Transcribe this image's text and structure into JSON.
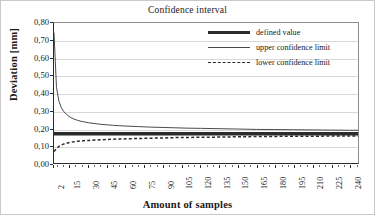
{
  "chart_data": {
    "type": "line",
    "title": "Confidence interval",
    "xlabel": "Amount of samples",
    "ylabel": "Deviation [mm]",
    "xlim": [
      2,
      247
    ],
    "ylim": [
      0.0,
      0.8
    ],
    "ytick_step": 0.1,
    "grid": "horizontal",
    "legend_position": "top-right",
    "decimal_separator": ",",
    "ytick_labels": [
      "0,80",
      "0,70",
      "0,60",
      "0,50",
      "0,40",
      "0,30",
      "0,20",
      "0,10",
      "0,00"
    ],
    "ytick_values": [
      0.8,
      0.7,
      0.6,
      0.5,
      0.4,
      0.3,
      0.2,
      0.1,
      0.0
    ],
    "xtick_labels": [
      "2",
      "15",
      "30",
      "45",
      "60",
      "75",
      "90",
      "105",
      "120",
      "135",
      "150",
      "165",
      "180",
      "195",
      "210",
      "225",
      "240"
    ],
    "xtick_values": [
      2,
      15,
      30,
      45,
      60,
      75,
      90,
      105,
      120,
      135,
      150,
      165,
      180,
      195,
      210,
      225,
      240
    ],
    "series": [
      {
        "name": "defined value",
        "style": "thick-solid",
        "color": "#2b2b2b",
        "constant": 0.167,
        "x": [
          2,
          247
        ],
        "values": [
          0.167,
          0.167
        ]
      },
      {
        "name": "upper confidence limit",
        "style": "thin-solid",
        "color": "#4a4a4a",
        "x": [
          2,
          4,
          6,
          8,
          10,
          12,
          15,
          18,
          21,
          24,
          27,
          30,
          35,
          40,
          45,
          50,
          55,
          60,
          70,
          80,
          90,
          100,
          110,
          120,
          135,
          150,
          165,
          180,
          195,
          210,
          225,
          240,
          247
        ],
        "values": [
          0.745,
          0.432,
          0.352,
          0.315,
          0.293,
          0.278,
          0.262,
          0.251,
          0.244,
          0.238,
          0.234,
          0.23,
          0.225,
          0.221,
          0.218,
          0.215,
          0.213,
          0.211,
          0.208,
          0.205,
          0.203,
          0.201,
          0.199,
          0.198,
          0.196,
          0.194,
          0.192,
          0.191,
          0.19,
          0.189,
          0.188,
          0.187,
          0.187
        ]
      },
      {
        "name": "lower confidence limit",
        "style": "dashed",
        "color": "#2b2b2b",
        "x": [
          2,
          4,
          6,
          8,
          10,
          12,
          15,
          18,
          21,
          24,
          27,
          30,
          35,
          40,
          45,
          50,
          55,
          60,
          70,
          80,
          90,
          100,
          110,
          120,
          135,
          150,
          165,
          180,
          195,
          210,
          225,
          240,
          247
        ],
        "values": [
          0.065,
          0.082,
          0.095,
          0.103,
          0.109,
          0.113,
          0.118,
          0.121,
          0.124,
          0.126,
          0.128,
          0.129,
          0.131,
          0.133,
          0.134,
          0.136,
          0.137,
          0.138,
          0.14,
          0.142,
          0.143,
          0.145,
          0.146,
          0.147,
          0.148,
          0.15,
          0.151,
          0.152,
          0.153,
          0.153,
          0.154,
          0.155,
          0.155
        ]
      }
    ]
  },
  "legend": {
    "items": [
      {
        "label": "defined value"
      },
      {
        "label": "upper confidence limit"
      },
      {
        "label": "lower confidence limit"
      }
    ]
  }
}
